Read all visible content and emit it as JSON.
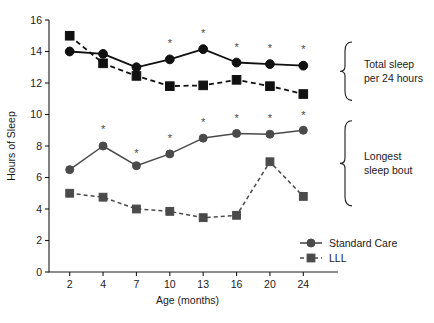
{
  "chart_data": {
    "type": "line",
    "title": "",
    "xlabel": "Age (months)",
    "ylabel": "Hours of Sleep",
    "x": [
      2,
      4,
      7,
      10,
      13,
      16,
      20,
      24
    ],
    "categories": [
      "2",
      "4",
      "7",
      "10",
      "13",
      "16",
      "20",
      "24"
    ],
    "xlim": [
      0,
      9
    ],
    "ylim": [
      0,
      16
    ],
    "yticks": [
      0,
      2,
      4,
      6,
      8,
      10,
      12,
      14,
      16
    ],
    "ytick_labels": [
      "0",
      "2",
      "4",
      "6",
      "8",
      "10",
      "12",
      "14",
      "16"
    ],
    "grid": false,
    "legend_position": "bottom-right",
    "groups": [
      {
        "name": "Total sleep per 24 hours",
        "label_line1": "Total sleep",
        "label_line2": "per 24 hours",
        "series": [
          {
            "name": "Standard Care",
            "marker": "circle",
            "linestyle": "solid",
            "color": "#111111",
            "values": [
              14.0,
              13.85,
              13.0,
              13.5,
              14.15,
              13.3,
              13.2,
              13.1
            ]
          },
          {
            "name": "LLL",
            "marker": "square",
            "linestyle": "dashed",
            "color": "#111111",
            "values": [
              15.0,
              13.25,
              12.45,
              11.8,
              11.85,
              12.2,
              11.8,
              11.3
            ]
          }
        ],
        "significance_markers": {
          "symbol": "*",
          "at_x": [
            10,
            13,
            16,
            20,
            24
          ],
          "at_y": [
            14.55,
            15.2,
            14.3,
            14.25,
            14.15
          ]
        }
      },
      {
        "name": "Longest sleep bout",
        "label_line1": "Longest",
        "label_line2": "sleep bout",
        "series": [
          {
            "name": "Standard Care",
            "marker": "circle",
            "linestyle": "solid",
            "color": "#4a4a4a",
            "values": [
              6.5,
              8.0,
              6.75,
              7.5,
              8.5,
              8.8,
              8.75,
              9.0
            ]
          },
          {
            "name": "LLL",
            "marker": "square",
            "linestyle": "dashed",
            "color": "#4a4a4a",
            "values": [
              5.0,
              4.75,
              4.0,
              3.85,
              3.45,
              3.6,
              7.0,
              4.8
            ]
          }
        ],
        "significance_markers": {
          "symbol": "*",
          "at_x": [
            4,
            7,
            10,
            13,
            16,
            20,
            24
          ],
          "at_y": [
            9.05,
            7.55,
            8.5,
            9.5,
            9.8,
            9.75,
            10.0
          ]
        }
      }
    ],
    "legend": [
      {
        "label": "Standard Care",
        "marker": "circle",
        "linestyle": "solid",
        "color": "#4a4a4a"
      },
      {
        "label": "LLL",
        "marker": "square",
        "linestyle": "dashed",
        "color": "#4a4a4a"
      }
    ],
    "annotations": [
      {
        "text": "Total sleep per 24 hours",
        "type": "brace-label"
      },
      {
        "text": "Longest sleep bout",
        "type": "brace-label"
      }
    ],
    "colors": {
      "top_group": "#111111",
      "bottom_group": "#4a4a4a",
      "axis": "#1a1a1a",
      "background": "#ffffff"
    }
  }
}
